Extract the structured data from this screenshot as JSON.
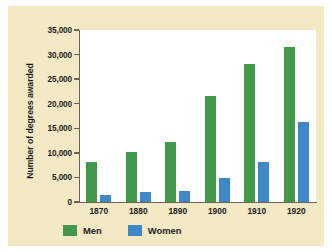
{
  "chart_data": {
    "type": "bar",
    "title": "",
    "subtitle": "",
    "xlabel": "",
    "ylabel": "Number of degrees awarded",
    "categories": [
      "1870",
      "1880",
      "1890",
      "1900",
      "1910",
      "1920"
    ],
    "series": [
      {
        "name": "Men",
        "color": "#42994b",
        "values": [
          8200,
          10100,
          12300,
          21500,
          28100,
          31500
        ]
      },
      {
        "name": "Women",
        "color": "#3f88c5",
        "values": [
          1500,
          2000,
          2300,
          4800,
          8200,
          16300
        ]
      }
    ],
    "ylim": [
      0,
      35000
    ],
    "ytick_values": [
      0,
      5000,
      10000,
      15000,
      20000,
      25000,
      30000,
      35000
    ],
    "ytick_labels": [
      "0",
      "5,000",
      "10,000",
      "15,000",
      "20,000",
      "25,000",
      "30,000",
      "35,000"
    ],
    "grid": false,
    "legend_position": "bottom-left",
    "legend_entries": [
      "Men",
      "Women"
    ]
  },
  "theme": {
    "mat_background": "#f3e9c4",
    "plot_background": "#ffffff",
    "axis_color": "#6b6555",
    "text_color": "#1c1c1c",
    "men_color": "#42994b",
    "women_color": "#3f88c5"
  }
}
